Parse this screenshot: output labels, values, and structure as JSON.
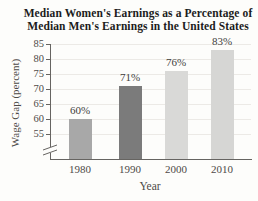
{
  "figure": {
    "title_line1": "Median Women's Earnings as a Percentage of",
    "title_line2": "Median Men's Earnings in the United States"
  },
  "chart_data": {
    "type": "bar",
    "title": "Median Women's Earnings as a Percentage of Median Men's Earnings in the United States",
    "categories": [
      "1980",
      "1990",
      "2000",
      "2010"
    ],
    "values": [
      60,
      71,
      76,
      83
    ],
    "bar_labels": [
      "60%",
      "71%",
      "76%",
      "83%"
    ],
    "bar_colors": [
      "#a8a8a8",
      "#7b7b7b",
      "#d9d9d7",
      "#d6d6d4"
    ],
    "xlabel": "Year",
    "ylabel": "Wage Gap (percent)",
    "yticks": [
      55,
      60,
      65,
      70,
      75,
      80,
      85
    ],
    "ylim": [
      55,
      85
    ],
    "axis_break": true,
    "grid": "horizontal",
    "legend": "none",
    "gridline_color": "#eceae6",
    "axis_color": "#666461",
    "text_color": "#4d4a47",
    "title_color": "#1c1c1c"
  }
}
